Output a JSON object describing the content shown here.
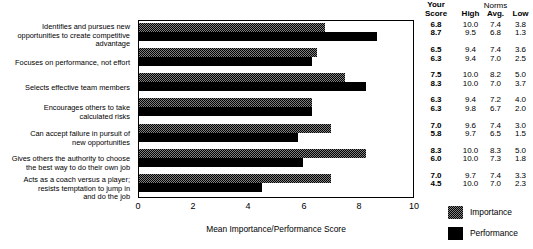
{
  "chart_data": {
    "type": "bar",
    "title": "",
    "xlabel": "Mean Importance/Performance Score",
    "ylabel": "",
    "xlim": [
      0,
      10
    ],
    "xticks": [
      0,
      2,
      4,
      6,
      8,
      10
    ],
    "grid": false,
    "orientation": "horizontal",
    "legend_position": "bottom-right",
    "categories": [
      "Identifies and pursues new opportunities to create competitive advantage",
      "Focuses on performance, not effort",
      "Selects effective team members",
      "Encourages others to take calculated risks",
      "Can accept failure in pursuit of new opportunities",
      "Gives others the authority to choose the best way to do their own job",
      "Acts as a coach versus a player; resists temptation to jump in and do the job"
    ],
    "series": [
      {
        "name": "Importance",
        "values": [
          6.8,
          6.5,
          7.5,
          6.3,
          7.0,
          8.3,
          7.0
        ]
      },
      {
        "name": "Performance",
        "values": [
          8.7,
          6.3,
          8.3,
          6.3,
          5.8,
          6.0,
          4.5
        ]
      }
    ]
  },
  "table": {
    "your_score_header_line1": "Your",
    "your_score_header_line2": "Score",
    "norms_header": "Norms",
    "columns": [
      "High",
      "Avg.",
      "Low"
    ],
    "rows": [
      {
        "score_importance": "6.8",
        "score_performance": "8.7",
        "high_importance": "10.0",
        "avg_importance": "7.4",
        "low_importance": "3.8",
        "high_performance": "9.5",
        "avg_performance": "6.8",
        "low_performance": "1.3"
      },
      {
        "score_importance": "6.5",
        "score_performance": "6.3",
        "high_importance": "9.4",
        "avg_importance": "7.4",
        "low_importance": "3.6",
        "high_performance": "9.4",
        "avg_performance": "7.0",
        "low_performance": "2.5"
      },
      {
        "score_importance": "7.5",
        "score_performance": "8.3",
        "high_importance": "10.0",
        "avg_importance": "8.2",
        "low_importance": "5.0",
        "high_performance": "10.0",
        "avg_performance": "7.0",
        "low_performance": "3.7"
      },
      {
        "score_importance": "6.3",
        "score_performance": "6.3",
        "high_importance": "9.4",
        "avg_importance": "7.2",
        "low_importance": "4.0",
        "high_performance": "9.8",
        "avg_performance": "6.7",
        "low_performance": "2.0"
      },
      {
        "score_importance": "7.0",
        "score_performance": "5.8",
        "high_importance": "9.6",
        "avg_importance": "7.4",
        "low_importance": "3.0",
        "high_performance": "9.7",
        "avg_performance": "6.5",
        "low_performance": "1.5"
      },
      {
        "score_importance": "8.3",
        "score_performance": "6.0",
        "high_importance": "10.0",
        "avg_importance": "8.3",
        "low_importance": "5.0",
        "high_performance": "10.0",
        "avg_performance": "7.3",
        "low_performance": "1.8"
      },
      {
        "score_importance": "7.0",
        "score_performance": "4.5",
        "high_importance": "9.7",
        "avg_importance": "7.4",
        "low_importance": "3.3",
        "high_performance": "10.0",
        "avg_performance": "7.0",
        "low_performance": "2.3"
      }
    ]
  },
  "legend": {
    "importance_label": "Importance",
    "performance_label": "Performance"
  },
  "colors": {
    "importance": "#808080",
    "performance": "#000000",
    "axis": "#000000",
    "background": "#ffffff"
  },
  "labels": {
    "cat0_line1": "Identifies and pursues new",
    "cat0_line2": "opportunities to create competitive",
    "cat0_line3": "advantage",
    "cat1_line1": "Focuses on performance, not effort",
    "cat2_line1": "Selects effective team members",
    "cat3_line1": "Encourages others to take",
    "cat3_line2": "calculated risks",
    "cat4_line1": "Can accept failure in pursuit of",
    "cat4_line2": "new opportunities",
    "cat5_line1": "Gives others the authority to choose",
    "cat5_line2": "the best way to do their own job",
    "cat6_line1": "Acts as a coach versus a player;",
    "cat6_line2": "resists temptation to jump in",
    "cat6_line3": "and do the job",
    "tick0": "0",
    "tick1": "2",
    "tick2": "4",
    "tick3": "6",
    "tick4": "8",
    "tick5": "10"
  }
}
